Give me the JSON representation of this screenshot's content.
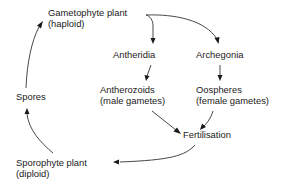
{
  "diagram": {
    "type": "life-cycle",
    "nodes": {
      "gametophyte": {
        "line1": "Gametophyte plant",
        "line2": "(haploid)"
      },
      "antheridia": {
        "line1": "Antheridia"
      },
      "archegonia": {
        "line1": "Archegonia"
      },
      "antherozoids": {
        "line1": "Antherozoids",
        "line2": "(male gametes)"
      },
      "oospheres": {
        "line1": "Oospheres",
        "line2": "(female gametes)"
      },
      "fertilisation": {
        "line1": "Fertilisation"
      },
      "sporophyte": {
        "line1": "Sporophyte plant",
        "line2": "(diploid)"
      },
      "spores": {
        "line1": "Spores"
      }
    },
    "edges": [
      {
        "from": "Gametophyte plant",
        "to": "Antheridia"
      },
      {
        "from": "Gametophyte plant",
        "to": "Archegonia"
      },
      {
        "from": "Antheridia",
        "to": "Antherozoids"
      },
      {
        "from": "Archegonia",
        "to": "Oospheres"
      },
      {
        "from": "Antherozoids",
        "to": "Fertilisation"
      },
      {
        "from": "Oospheres",
        "to": "Fertilisation"
      },
      {
        "from": "Fertilisation",
        "to": "Sporophyte plant"
      },
      {
        "from": "Sporophyte plant",
        "to": "Spores"
      },
      {
        "from": "Spores",
        "to": "Gametophyte plant"
      }
    ],
    "colors": {
      "text": "#1a1a1a",
      "line": "#333333",
      "background": "#ffffff"
    }
  }
}
